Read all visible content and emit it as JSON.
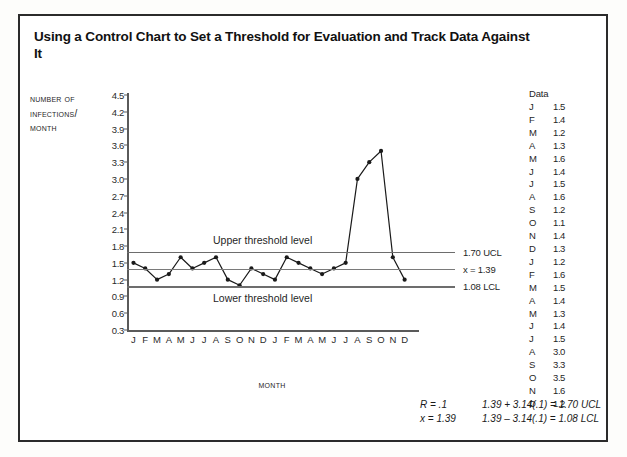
{
  "title": "Using a Control Chart to Set a Threshold for Evaluation and Track Data Against It",
  "chart_data": {
    "type": "line",
    "title": "Using a Control Chart to Set a Threshold for Evaluation and Track Data Against It",
    "xlabel": "Month",
    "ylabel_lines": [
      "Number of",
      "Infections/",
      "Month"
    ],
    "ylabel": "Number of Infections/Month",
    "ylim": [
      0.3,
      4.5
    ],
    "ytick_step": 0.3,
    "yticks": [
      "4.5",
      "4.2",
      "3.9",
      "3.6",
      "3.3",
      "3.0",
      "2.7",
      "2.4",
      "2.1",
      "1.8",
      "1.5",
      "1.2",
      "0.9",
      "0.6",
      "0.3"
    ],
    "ytick_values": [
      4.5,
      4.2,
      3.9,
      3.6,
      3.3,
      3.0,
      2.7,
      2.4,
      2.1,
      1.8,
      1.5,
      1.2,
      0.9,
      0.6,
      0.3
    ],
    "categories": [
      "J",
      "F",
      "M",
      "A",
      "M",
      "J",
      "J",
      "A",
      "S",
      "O",
      "N",
      "D",
      "J",
      "F",
      "M",
      "A",
      "M",
      "J",
      "J",
      "A",
      "S",
      "O",
      "N",
      "D"
    ],
    "values": [
      1.5,
      1.4,
      1.2,
      1.3,
      1.6,
      1.4,
      1.5,
      1.6,
      1.2,
      1.1,
      1.4,
      1.3,
      1.2,
      1.6,
      1.5,
      1.4,
      1.3,
      1.4,
      1.5,
      3.0,
      3.3,
      3.5,
      1.6,
      1.2
    ],
    "grid": false,
    "legend": "none",
    "marker": "filled-circle",
    "reference_lines": [
      {
        "name": "ucl",
        "value": 1.7,
        "label": "1.70 UCL"
      },
      {
        "name": "mean",
        "value": 1.39,
        "label": "x = 1.39"
      },
      {
        "name": "lcl",
        "value": 1.08,
        "label": "1.08 LCL"
      }
    ],
    "annotations": [
      {
        "name": "upper-threshold",
        "text": "Upper threshold level"
      },
      {
        "name": "lower-threshold",
        "text": "Lower threshold level"
      }
    ]
  },
  "data_table": {
    "header": "Data",
    "rows": [
      {
        "month": "J",
        "value": "1.5"
      },
      {
        "month": "F",
        "value": "1.4"
      },
      {
        "month": "M",
        "value": "1.2"
      },
      {
        "month": "A",
        "value": "1.3"
      },
      {
        "month": "M",
        "value": "1.6"
      },
      {
        "month": "J",
        "value": "1.4"
      },
      {
        "month": "J",
        "value": "1.5"
      },
      {
        "month": "A",
        "value": "1.6"
      },
      {
        "month": "S",
        "value": "1.2"
      },
      {
        "month": "O",
        "value": "1.1"
      },
      {
        "month": "N",
        "value": "1.4"
      },
      {
        "month": "D",
        "value": "1.3"
      },
      {
        "month": "J",
        "value": "1.2"
      },
      {
        "month": "F",
        "value": "1.6"
      },
      {
        "month": "M",
        "value": "1.5"
      },
      {
        "month": "A",
        "value": "1.4"
      },
      {
        "month": "M",
        "value": "1.3"
      },
      {
        "month": "J",
        "value": "1.4"
      },
      {
        "month": "J",
        "value": "1.5"
      },
      {
        "month": "A",
        "value": "3.0"
      },
      {
        "month": "S",
        "value": "3.3"
      },
      {
        "month": "O",
        "value": "3.5"
      },
      {
        "month": "N",
        "value": "1.6"
      },
      {
        "month": "D",
        "value": "1.2"
      }
    ]
  },
  "formulas": {
    "line1_left": "R = .1",
    "line1_right": "1.39 + 3.14(.1) = 1.70 UCL",
    "line2_left": "x = 1.39",
    "line2_right": "1.39 – 3.14(.1) = 1.08 LCL"
  },
  "colors": {
    "line": "#1a1a1a",
    "reference_line": "#6d6d6d",
    "axis": "#5a5a5a",
    "frame": "#2b2b2b",
    "text": "#1f1f1f"
  }
}
